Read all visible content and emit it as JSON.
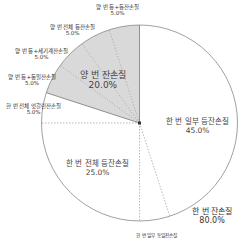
{
  "chart_data": {
    "type": "pie",
    "title": "",
    "start_angle_deg": 0,
    "direction": "clockwise",
    "slices": [
      {
        "label": "한 번 일부 등잔손질",
        "value": 45.0,
        "pct_label": "45.0%",
        "group": "한 번 잔손질",
        "fill": "#ffffff"
      },
      {
        "label": "한 번 일부 동일잔손질",
        "value": 5.0,
        "pct_label": "",
        "group": "한 번 잔손질",
        "fill": "#ffffff"
      },
      {
        "label": "한 번 전체 등잔손질",
        "value": 25.0,
        "pct_label": "25.0%",
        "group": "한 번 잔손질",
        "fill": "#ffffff"
      },
      {
        "label": "한 번 전체 엇갈린잔손질",
        "value": 5.0,
        "pct_label": "5.0%",
        "group": "한 번 잔손질",
        "fill": "#ffffff"
      },
      {
        "label": "양 번 등+동일잔손질",
        "value": 5.0,
        "pct_label": "5.0%",
        "group": "양 번 잔손질",
        "fill": "#d9d9d9"
      },
      {
        "label": "양 번 등+세기계잔손질",
        "value": 5.0,
        "pct_label": "5.0%",
        "group": "양 번 잔손질",
        "fill": "#d9d9d9"
      },
      {
        "label": "양 번 전체 등잔손질",
        "value": 5.0,
        "pct_label": "5.0%",
        "group": "양 번 잔손질",
        "fill": "#d9d9d9"
      },
      {
        "label": "양 번 등+등잔손질",
        "value": 5.0,
        "pct_label": "5.0%",
        "group": "양 번 잔손질",
        "fill": "#d9d9d9"
      }
    ],
    "groups": [
      {
        "label": "한 번 잔손질",
        "value": 80.0,
        "pct_label": "80.0%"
      },
      {
        "label": "양 번 잔손질",
        "value": 20.0,
        "pct_label": "20.0%"
      }
    ],
    "colors": {
      "shaded": "#d9d9d9",
      "unshaded": "#ffffff",
      "outline": "#888888",
      "dash": "#999999"
    }
  },
  "labels": {
    "top1": {
      "name": "양 번 등+등잔손질",
      "pct": "5.0%"
    },
    "top2": {
      "name": "양 번 전체 등잔손질",
      "pct": "5.0%"
    },
    "left1": {
      "name": "양 번 등+세기계잔손질",
      "pct": "5.0%"
    },
    "left2": {
      "name": "양 번 등+동일잔손질",
      "pct": "5.0%"
    },
    "left3": {
      "name": "한 번 전체 엇갈린잔손질",
      "pct": "5.0%"
    },
    "group_shaded": {
      "name": "양 번 잔손질",
      "pct": "20.0%"
    },
    "right_inner": {
      "name": "한 번 일부 등잔손질",
      "pct": "45.0%"
    },
    "lower_inner": {
      "name": "한 번 전체 등잔손질",
      "pct": "25.0%"
    },
    "group_outer": {
      "name": "한 번 잔손질",
      "pct": "80.0%"
    },
    "bottom": {
      "name": "한 번 일부 동일잔손질"
    }
  }
}
